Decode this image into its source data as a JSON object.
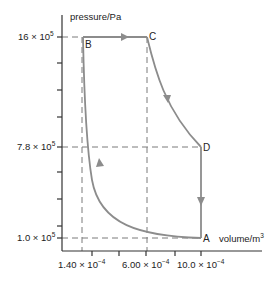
{
  "diagram": {
    "type": "pressure-volume cycle",
    "y_axis": {
      "label": "pressure/Pa",
      "ticks": [
        {
          "mantissa": "16",
          "exp": "5",
          "value": 1600000
        },
        {
          "mantissa": "7.8",
          "exp": "5",
          "value": 780000
        },
        {
          "mantissa": "1.0",
          "exp": "5",
          "value": 100000
        }
      ]
    },
    "x_axis": {
      "label_base": "volume/m",
      "label_exp": "3",
      "ticks": [
        {
          "mantissa": "1.40",
          "exp": "−4",
          "value": 0.00014
        },
        {
          "mantissa": "6.00",
          "exp": "−4",
          "value": 0.0006
        },
        {
          "mantissa": "10.0",
          "exp": "−4",
          "value": 0.001
        }
      ]
    },
    "times_sign": "×",
    "base": "10",
    "points": {
      "A": {
        "label": "A",
        "volume": 0.001,
        "pressure": 100000
      },
      "B": {
        "label": "B",
        "volume": 0.00014,
        "pressure": 1600000
      },
      "C": {
        "label": "C",
        "volume": 0.0006,
        "pressure": 1600000
      },
      "D": {
        "label": "D",
        "volume": 0.001,
        "pressure": 780000
      }
    },
    "processes": [
      {
        "from": "A",
        "to": "B",
        "shape": "curve",
        "direction": "up-left"
      },
      {
        "from": "B",
        "to": "C",
        "shape": "horizontal",
        "direction": "right"
      },
      {
        "from": "C",
        "to": "D",
        "shape": "curve",
        "direction": "down-right"
      },
      {
        "from": "D",
        "to": "A",
        "shape": "vertical",
        "direction": "down"
      }
    ],
    "colors": {
      "axis": "#333333",
      "cycle": "#8c8c8c",
      "dashed": "#7a7a7a",
      "text": "#222222"
    }
  }
}
